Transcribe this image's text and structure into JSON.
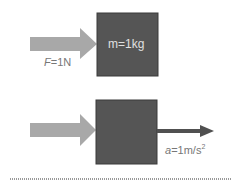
{
  "top": {
    "force_label_var": "F",
    "force_label_rest": "=1N",
    "mass_label": "m=1kg"
  },
  "bottom": {
    "accel_label_var": "a",
    "accel_label_rest": "=1m/s",
    "accel_label_sup": "2"
  },
  "colors": {
    "block": "#555555",
    "force_arrow": "#a8a8a8",
    "accel_arrow": "#505050"
  }
}
